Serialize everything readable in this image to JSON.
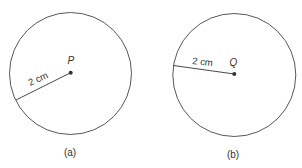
{
  "figures": [
    {
      "id": "a",
      "caption": "(a)",
      "center_label": "P",
      "radius_label": "2 cm",
      "circle": {
        "cx": 70.5,
        "cy": 73.5,
        "r": 61
      },
      "radius_end": {
        "x": 16,
        "y": 100
      }
    },
    {
      "id": "b",
      "caption": "(b)",
      "center_label": "Q",
      "radius_label": "2 cm",
      "circle": {
        "cx": 234.3,
        "cy": 75,
        "r": 61.5
      },
      "radius_end": {
        "x": 173.5,
        "y": 65.5
      }
    }
  ],
  "colors": {
    "stroke": "#444444",
    "point": "#333333",
    "text": "#333333"
  }
}
